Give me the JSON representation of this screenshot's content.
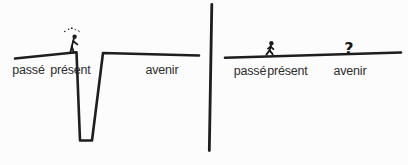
{
  "diagram": {
    "description_colors": {
      "ink": "#1e1e1e",
      "text": "#2d2d2d",
      "background": "#fcfcfc"
    },
    "left_panel": {
      "label_past": "passé",
      "label_present": "présent",
      "label_future": "avenir"
    },
    "right_panel": {
      "label_past": "passé",
      "label_present": "présent",
      "label_future": "avenir",
      "question_mark": "?"
    }
  }
}
